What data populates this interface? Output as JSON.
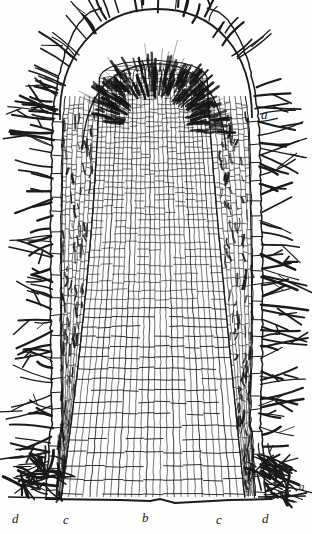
{
  "figure": {
    "style": "line engraving",
    "background_color": "#fefefe",
    "ink_color": "#1a1a1a",
    "width": 312,
    "height": 534
  },
  "labels": [
    {
      "id": "a-upper",
      "text": "a",
      "x": 261,
      "y": 108,
      "size": "normal",
      "refers_to": "root cap / calyptra outer layer"
    },
    {
      "id": "a-lower",
      "text": "a",
      "x": 299,
      "y": 481,
      "size": "small",
      "refers_to": "root cap / calyptra outer layer"
    },
    {
      "id": "d-left",
      "text": "d",
      "x": 12,
      "y": 512,
      "size": "normal",
      "refers_to": "epidermis with root hairs (left)"
    },
    {
      "id": "c-left",
      "text": "c",
      "x": 63,
      "y": 513,
      "size": "normal",
      "refers_to": "cortex (left)"
    },
    {
      "id": "b-center",
      "text": "b",
      "x": 142,
      "y": 511,
      "size": "normal",
      "refers_to": "central cylinder / plerome"
    },
    {
      "id": "c-right",
      "text": "c",
      "x": 216,
      "y": 513,
      "size": "normal",
      "refers_to": "cortex (right)"
    },
    {
      "id": "d-right",
      "text": "d",
      "x": 262,
      "y": 512,
      "size": "normal",
      "refers_to": "epidermis with root hairs (right)"
    }
  ],
  "regions": [
    {
      "name": "root-cap",
      "key": "a",
      "description": "dome-shaped calyptra of elongated dark cells covering the apex"
    },
    {
      "name": "central-cylinder",
      "key": "b",
      "description": "inner core of fine tabular meristem cells"
    },
    {
      "name": "cortex",
      "key": "c",
      "description": "columns of larger rectangular parenchyma cells"
    },
    {
      "name": "epidermis",
      "key": "d",
      "description": "outer cell layer bearing long root hairs"
    }
  ],
  "geometry": {
    "apex_y": 8,
    "base_y": 500,
    "core_left": 92,
    "core_right": 214,
    "outline_left": 52,
    "outline_right": 258,
    "hair_extent_left": 8,
    "hair_extent_right": 304
  }
}
